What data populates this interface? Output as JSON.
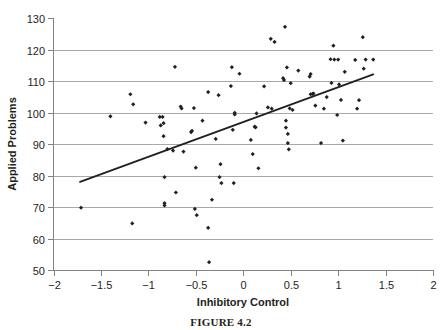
{
  "figure": {
    "caption": "FIGURE 4.2"
  },
  "chart_data": {
    "type": "scatter",
    "title": "",
    "xlabel": "Inhibitory Control",
    "ylabel": "Applied Problems",
    "xlim": [
      -2,
      2
    ],
    "ylim": [
      50,
      130
    ],
    "xticks": [
      -2,
      -1.5,
      -1,
      -0.5,
      0,
      0.5,
      1,
      1.5,
      2
    ],
    "xtick_labels": [
      "−2",
      "−1.5",
      "−1",
      "−0.5",
      "0",
      "0.5",
      "1",
      "1.5",
      "2"
    ],
    "yticks": [
      50,
      60,
      70,
      80,
      90,
      100,
      110,
      120,
      130
    ],
    "ytick_labels": [
      "50",
      "60",
      "70",
      "80",
      "90",
      "100",
      "110",
      "120",
      "130"
    ],
    "grid": "horizontal",
    "legend": "none",
    "marker": "diamond",
    "marker_color": "#231f20",
    "point_count": 92,
    "points": [
      [
        -1.71,
        69.8
      ],
      [
        -1.4,
        98.8
      ],
      [
        -1.19,
        105.8
      ],
      [
        -1.17,
        64.8
      ],
      [
        -1.16,
        102.6
      ],
      [
        -1.03,
        96.8
      ],
      [
        -0.88,
        98.6
      ],
      [
        -0.87,
        95.9
      ],
      [
        -0.85,
        98.6
      ],
      [
        -0.84,
        96.6
      ],
      [
        -0.84,
        92.5
      ],
      [
        -0.83,
        79.5
      ],
      [
        -0.83,
        71.2
      ],
      [
        -0.83,
        70.5
      ],
      [
        -0.8,
        88.4
      ],
      [
        -0.74,
        87.9
      ],
      [
        -0.72,
        114.5
      ],
      [
        -0.71,
        74.6
      ],
      [
        -0.66,
        101.9
      ],
      [
        -0.65,
        101.3
      ],
      [
        -0.63,
        87.6
      ],
      [
        -0.55,
        93.8
      ],
      [
        -0.54,
        94.2
      ],
      [
        -0.52,
        101.4
      ],
      [
        -0.51,
        69.4
      ],
      [
        -0.5,
        82.5
      ],
      [
        -0.49,
        67.4
      ],
      [
        -0.43,
        97.4
      ],
      [
        -0.37,
        106.5
      ],
      [
        -0.37,
        63.4
      ],
      [
        -0.36,
        52.5
      ],
      [
        -0.33,
        72.3
      ],
      [
        -0.29,
        91.6
      ],
      [
        -0.26,
        105.5
      ],
      [
        -0.25,
        79.5
      ],
      [
        -0.24,
        83.6
      ],
      [
        -0.23,
        77.6
      ],
      [
        -0.13,
        108.4
      ],
      [
        -0.12,
        114.4
      ],
      [
        -0.11,
        94.5
      ],
      [
        -0.1,
        77.6
      ],
      [
        -0.09,
        99.9
      ],
      [
        -0.09,
        99.4
      ],
      [
        -0.04,
        112.3
      ],
      [
        0.08,
        91.3
      ],
      [
        0.1,
        86.8
      ],
      [
        0.12,
        95.5
      ],
      [
        0.13,
        95.3
      ],
      [
        0.14,
        99.7
      ],
      [
        0.16,
        82.3
      ],
      [
        0.22,
        108.3
      ],
      [
        0.26,
        101.6
      ],
      [
        0.29,
        123.4
      ],
      [
        0.3,
        101.2
      ],
      [
        0.33,
        122.4
      ],
      [
        0.42,
        110.9
      ],
      [
        0.43,
        110.3
      ],
      [
        0.44,
        127.2
      ],
      [
        0.45,
        97.4
      ],
      [
        0.45,
        95.2
      ],
      [
        0.46,
        114.3
      ],
      [
        0.47,
        93.2
      ],
      [
        0.47,
        90.3
      ],
      [
        0.48,
        88.3
      ],
      [
        0.49,
        101.3
      ],
      [
        0.5,
        109.3
      ],
      [
        0.52,
        100.8
      ],
      [
        0.58,
        113.3
      ],
      [
        0.7,
        111.4
      ],
      [
        0.71,
        112.2
      ],
      [
        0.71,
        105.8
      ],
      [
        0.73,
        105.9
      ],
      [
        0.74,
        106.0
      ],
      [
        0.76,
        102.2
      ],
      [
        0.82,
        90.3
      ],
      [
        0.85,
        101.2
      ],
      [
        0.88,
        104.9
      ],
      [
        0.92,
        116.9
      ],
      [
        0.93,
        109.4
      ],
      [
        0.95,
        121.2
      ],
      [
        0.96,
        116.8
      ],
      [
        0.99,
        99.2
      ],
      [
        1.0,
        116.8
      ],
      [
        1.01,
        108.9
      ],
      [
        1.03,
        104.0
      ],
      [
        1.05,
        91.1
      ],
      [
        1.07,
        112.9
      ],
      [
        1.18,
        116.7
      ],
      [
        1.2,
        101.2
      ],
      [
        1.22,
        103.9
      ],
      [
        1.26,
        123.9
      ],
      [
        1.27,
        113.9
      ],
      [
        1.29,
        116.8
      ],
      [
        1.37,
        116.8
      ]
    ],
    "fit_line": {
      "type": "linear-regression",
      "x_start": -1.72,
      "y_start": 78.0,
      "x_end": 1.37,
      "y_end": 112.1
    }
  }
}
